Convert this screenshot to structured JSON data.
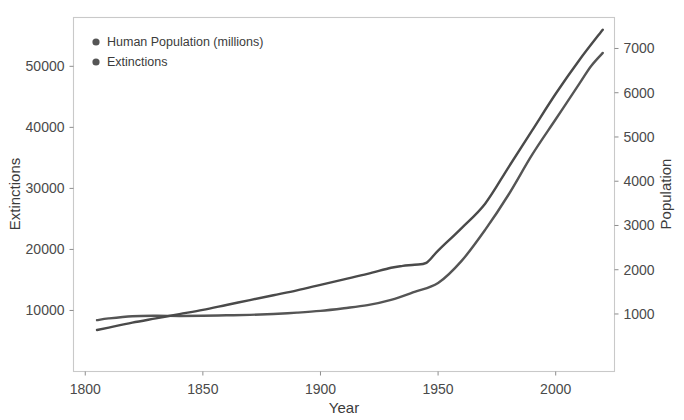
{
  "chart_data": {
    "type": "line",
    "title": "",
    "xlabel": "Year",
    "ylabel": "Extinctions",
    "y2label": "Population",
    "xlim": [
      1795,
      2025
    ],
    "ylim": [
      0,
      58000
    ],
    "y2lim": [
      -300,
      7700
    ],
    "xticks": [
      1800,
      1850,
      1900,
      1950,
      2000
    ],
    "yticks": [
      10000,
      20000,
      30000,
      40000,
      50000
    ],
    "y2ticks": [
      1000,
      2000,
      3000,
      4000,
      5000,
      6000,
      7000
    ],
    "grid": false,
    "legend_position": "top-left",
    "series": [
      {
        "name": "Human Population (millions)",
        "axis": "right",
        "color": "#555555",
        "marker": "circle",
        "x": [
          1805,
          1810,
          1820,
          1830,
          1840,
          1850,
          1860,
          1870,
          1880,
          1890,
          1900,
          1910,
          1920,
          1930,
          1940,
          1950,
          1960,
          1970,
          1980,
          1990,
          2000,
          2010,
          2015,
          2020
        ],
        "values": [
          860,
          900,
          950,
          960,
          955,
          960,
          970,
          980,
          1000,
          1030,
          1070,
          1130,
          1200,
          1320,
          1500,
          1700,
          2200,
          2900,
          3700,
          4600,
          5400,
          6200,
          6600,
          6900
        ]
      },
      {
        "name": "Extinctions",
        "axis": "left",
        "color": "#4a4a4a",
        "marker": "circle",
        "x": [
          1805,
          1810,
          1820,
          1830,
          1840,
          1850,
          1860,
          1870,
          1880,
          1890,
          1900,
          1910,
          1920,
          1930,
          1935,
          1940,
          1945,
          1950,
          1960,
          1970,
          1980,
          1990,
          2000,
          2010,
          2020
        ],
        "values": [
          6800,
          7200,
          8000,
          8700,
          9400,
          10100,
          10900,
          11700,
          12500,
          13300,
          14200,
          15100,
          16000,
          17000,
          17300,
          17500,
          17800,
          19800,
          23500,
          27500,
          33500,
          39500,
          45500,
          51000,
          56000
        ]
      }
    ]
  },
  "legend": {
    "items": [
      {
        "label": "Human Population (millions)",
        "color": "#555555"
      },
      {
        "label": "Extinctions",
        "color": "#555555"
      }
    ]
  },
  "axes": {
    "x_title": "Year",
    "y_left_title": "Extinctions",
    "y_right_title": "Population",
    "x_tick_labels": [
      "1800",
      "1850",
      "1900",
      "1950",
      "2000"
    ],
    "y_left_tick_labels": [
      "10000",
      "20000",
      "30000",
      "40000",
      "50000"
    ],
    "y_right_tick_labels": [
      "1000",
      "2000",
      "3000",
      "4000",
      "5000",
      "6000",
      "7000"
    ]
  },
  "style": {
    "background": "#ffffff",
    "frame_color": "#c9c9c9",
    "text_color": "#3b3b3b"
  }
}
